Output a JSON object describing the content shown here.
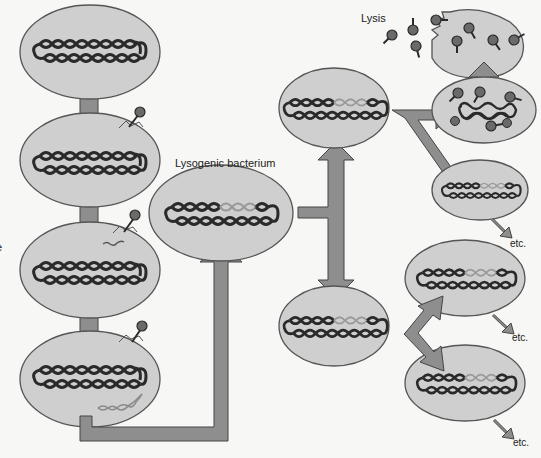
{
  "labels": {
    "lysogenic": "Lysogenic bacterium",
    "lysis": "Lysis",
    "etc1": "etc.",
    "etc2": "etc.",
    "etc3": "etc.",
    "edge_fragment": "e"
  },
  "colors": {
    "background": "#f7f7f5",
    "cell_fill": "#cfcfcf",
    "cell_stroke": "#555555",
    "arrow_fill": "#8e8e8e",
    "arrow_stroke": "#444444",
    "dna_dark": "#2a2a2a",
    "dna_prophage": "#9a9a9a",
    "phage": "#6a6a6a"
  },
  "cells": [
    {
      "id": "cell-1",
      "stage": "uninfected",
      "cx": 90,
      "cy": 52,
      "rx": 70,
      "ry": 47
    },
    {
      "id": "cell-2",
      "stage": "phage-attachment",
      "cx": 90,
      "cy": 160,
      "rx": 70,
      "ry": 47
    },
    {
      "id": "cell-3",
      "stage": "dna-injection",
      "cx": 90,
      "cy": 270,
      "rx": 70,
      "ry": 48
    },
    {
      "id": "cell-4",
      "stage": "phage-dna-in-cell",
      "cx": 90,
      "cy": 379,
      "rx": 70,
      "ry": 48
    },
    {
      "id": "cell-lysogenic",
      "stage": "lysogenic",
      "cx": 221,
      "cy": 213,
      "rx": 72,
      "ry": 48
    },
    {
      "id": "cell-mid-top",
      "stage": "prophage",
      "cx": 334,
      "cy": 108,
      "rx": 55,
      "ry": 40
    },
    {
      "id": "cell-mid-bottom",
      "stage": "prophage",
      "cx": 334,
      "cy": 326,
      "rx": 55,
      "ry": 40
    },
    {
      "id": "cell-lysis",
      "stage": "lysis",
      "cx": 484,
      "cy": 43,
      "rx": 52,
      "ry": 33
    },
    {
      "id": "cell-phage-assembly",
      "stage": "phage-assembly",
      "cx": 484,
      "cy": 110,
      "rx": 52,
      "ry": 33
    },
    {
      "id": "cell-right-small",
      "stage": "prophage",
      "cx": 480,
      "cy": 190,
      "rx": 48,
      "ry": 30
    },
    {
      "id": "cell-right-mid",
      "stage": "prophage",
      "cx": 465,
      "cy": 278,
      "rx": 60,
      "ry": 38
    },
    {
      "id": "cell-right-bottom",
      "stage": "prophage",
      "cx": 465,
      "cy": 383,
      "rx": 60,
      "ry": 38
    }
  ]
}
